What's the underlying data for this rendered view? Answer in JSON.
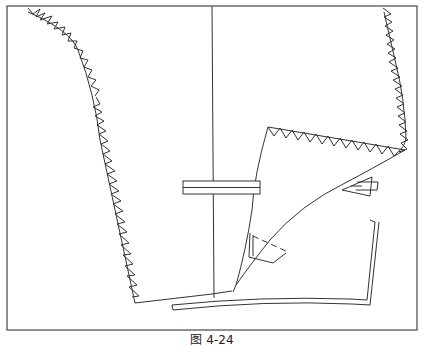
{
  "figure": {
    "type": "garment pattern diagram",
    "caption": "图 4-24",
    "colors": {
      "line": "#333333",
      "frame": "#555555",
      "background": "#ffffff"
    }
  }
}
